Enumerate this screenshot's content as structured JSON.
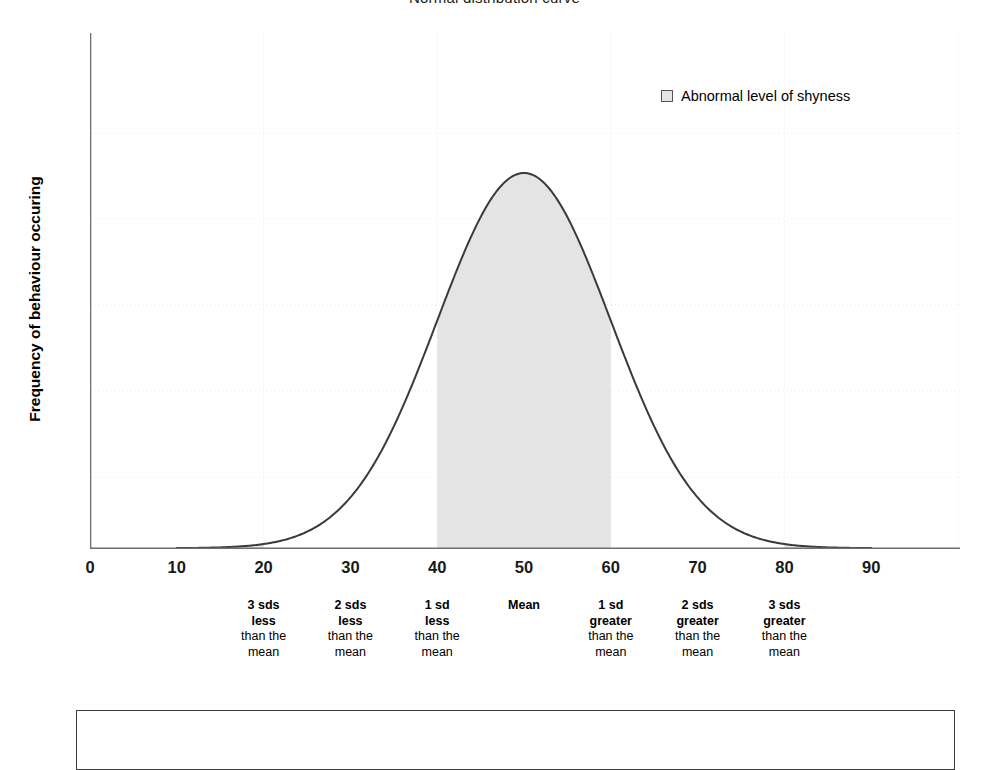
{
  "chart_data": {
    "type": "area",
    "title": "Normal distribution curve",
    "xlabel": "",
    "ylabel": "Frequency of behaviour occuring",
    "xlim": [
      0,
      100
    ],
    "ylim": [
      0,
      1.12
    ],
    "grid": true,
    "legend_position": "top-right",
    "legend": [
      {
        "label": "Abnormal level of shyness",
        "color": "#e4e4e4",
        "border": "#555555"
      }
    ],
    "curve": {
      "name": "Normal distribution",
      "mean": 50,
      "sd": 10,
      "color": "#3a3a3a",
      "line_width": 2,
      "x_start": 10,
      "x_end": 90,
      "peak_x": 50,
      "peak_y": 1.0,
      "x": [
        10,
        15,
        20,
        25,
        30,
        35,
        40,
        45,
        50,
        55,
        60,
        65,
        70,
        75,
        80,
        85,
        90
      ],
      "y": [
        0.0,
        0.004,
        0.011,
        0.044,
        0.135,
        0.325,
        0.607,
        0.882,
        1.0,
        0.882,
        0.607,
        0.325,
        0.135,
        0.044,
        0.011,
        0.004,
        0.0
      ]
    },
    "shaded_regions": [
      {
        "name": "left-tail",
        "x_from": 10,
        "x_to": 20,
        "fill": "#e4e4e4",
        "clip": "under-curve"
      },
      {
        "name": "central-band",
        "x_from": 40,
        "x_to": 60,
        "fill": "#e4e4e4",
        "clip": "under-curve"
      },
      {
        "name": "right-tail",
        "x_from": 80,
        "x_to": 90,
        "fill": "#e4e4e4",
        "clip": "under-curve"
      }
    ],
    "xticks": [
      {
        "value": 0,
        "label": "0"
      },
      {
        "value": 10,
        "label": "10"
      },
      {
        "value": 20,
        "label": "20"
      },
      {
        "value": 30,
        "label": "30"
      },
      {
        "value": 40,
        "label": "40"
      },
      {
        "value": 50,
        "label": "50"
      },
      {
        "value": 60,
        "label": "60"
      },
      {
        "value": 70,
        "label": "70"
      },
      {
        "value": 80,
        "label": "80"
      },
      {
        "value": 90,
        "label": "90"
      }
    ],
    "annotations": [
      {
        "at_value": 20,
        "line1": "3 sds",
        "line2": "less",
        "line3": "than the",
        "line4": "mean"
      },
      {
        "at_value": 30,
        "line1": "2 sds",
        "line2": "less",
        "line3": "than the",
        "line4": "mean"
      },
      {
        "at_value": 40,
        "line1": "1 sd",
        "line2": "less",
        "line3": "than the",
        "line4": "mean"
      },
      {
        "at_value": 50,
        "line1": "Mean",
        "line2": "",
        "line3": "",
        "line4": ""
      },
      {
        "at_value": 60,
        "line1": "1 sd",
        "line2": "greater",
        "line3": "than the",
        "line4": "mean"
      },
      {
        "at_value": 70,
        "line1": "2 sds",
        "line2": "greater",
        "line3": "than the",
        "line4": "mean"
      },
      {
        "at_value": 80,
        "line1": "3 sds",
        "line2": "greater",
        "line3": "than the",
        "line4": "mean"
      }
    ]
  },
  "colors": {
    "curve": "#3a3a3a",
    "shade": "#e4e4e4",
    "axis": "#6e6e6e",
    "grid": "#e8e8e8",
    "text": "#000000",
    "box_border": "#3d3d3d"
  }
}
